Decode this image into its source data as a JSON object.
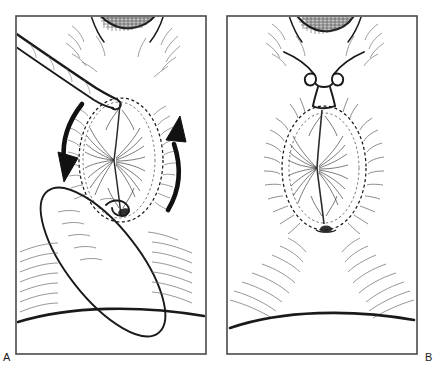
{
  "figure": {
    "type": "line-illustration",
    "background_color": "#ffffff",
    "ink_color": "#1a1a1a",
    "hatch_color": "#555555",
    "panel_border_color": "#4a4a4a",
    "width": 443,
    "height": 375
  },
  "panels": [
    {
      "id": "a",
      "label": "A",
      "label_position": "bottom-left-outside",
      "frame": {
        "x": 16,
        "y": 16,
        "width": 190,
        "height": 338
      },
      "elements": {
        "dashed_oval_label": "dashed incision outline",
        "left_arrow_label": "downward rotation arrow",
        "right_arrow_label": "upward rotation arrow",
        "rotated_ellipse_label": "rotated tissue flap outline",
        "top_anatomy_label": "cross-hatched anatomical region",
        "base_arc_label": "lower contour arc"
      }
    },
    {
      "id": "b",
      "label": "B",
      "label_position": "bottom-right-outside",
      "frame": {
        "x": 227,
        "y": 16,
        "width": 190,
        "height": 338
      },
      "elements": {
        "dashed_oval_label": "dashed closure outline",
        "suture_knot_label": "double-loop suture knot",
        "suture_tails_label": "suture thread tails",
        "top_anatomy_label": "cross-hatched anatomical region",
        "base_arc_label": "lower contour arc",
        "hatching_label": "radiating tissue hatching"
      }
    }
  ]
}
